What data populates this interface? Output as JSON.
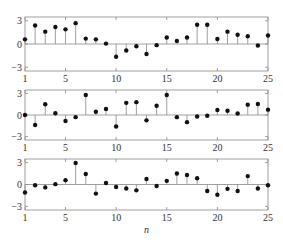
{
  "chart_data": [
    {
      "type": "stem",
      "title": "",
      "xlabel": "",
      "ylabel": "",
      "xlim": [
        1,
        25
      ],
      "ylim": [
        -3.5,
        3.5
      ],
      "xticks": [
        "1",
        "5",
        "10",
        "15",
        "20",
        "25"
      ],
      "yticks": [
        "3",
        "0",
        "-3"
      ],
      "grid": false,
      "x": [
        1,
        2,
        3,
        4,
        5,
        6,
        7,
        8,
        9,
        10,
        11,
        12,
        13,
        14,
        15,
        16,
        17,
        18,
        19,
        20,
        21,
        22,
        23,
        24,
        25
      ],
      "values": [
        0.6,
        2.4,
        1.6,
        2.2,
        1.9,
        2.7,
        0.7,
        0.6,
        0.05,
        -1.65,
        -0.85,
        -0.3,
        -1.3,
        -0.15,
        0.85,
        0.4,
        0.85,
        2.5,
        2.5,
        0.65,
        1.6,
        1.2,
        1.0,
        -0.2,
        1.1
      ]
    },
    {
      "type": "stem",
      "title": "",
      "xlabel": "",
      "ylabel": "",
      "xlim": [
        1,
        25
      ],
      "ylim": [
        -3.5,
        3.5
      ],
      "xticks": [
        "1",
        "5",
        "10",
        "15",
        "20",
        "25"
      ],
      "yticks": [
        "3",
        "0",
        "-3"
      ],
      "grid": false,
      "x": [
        1,
        2,
        3,
        4,
        5,
        6,
        7,
        8,
        9,
        10,
        11,
        12,
        13,
        14,
        15,
        16,
        17,
        18,
        19,
        20,
        21,
        22,
        23,
        24,
        25
      ],
      "values": [
        0.0,
        -1.4,
        1.5,
        0.25,
        -0.85,
        -0.3,
        2.8,
        0.45,
        0.85,
        -1.6,
        1.7,
        1.8,
        -0.75,
        1.3,
        2.8,
        -0.3,
        -1.0,
        -0.2,
        -0.1,
        0.7,
        0.6,
        0.2,
        1.45,
        1.55,
        0.75
      ]
    },
    {
      "type": "stem",
      "title": "",
      "xlabel": "n",
      "ylabel": "",
      "xlim": [
        1,
        25
      ],
      "ylim": [
        -3.5,
        3.5
      ],
      "xticks": [
        "1",
        "5",
        "10",
        "15",
        "20",
        "25"
      ],
      "yticks": [
        "3",
        "0",
        "-3"
      ],
      "grid": false,
      "x": [
        1,
        2,
        3,
        4,
        5,
        6,
        7,
        8,
        9,
        10,
        11,
        12,
        13,
        14,
        15,
        16,
        17,
        18,
        19,
        20,
        21,
        22,
        23,
        24,
        25
      ],
      "values": [
        -1.1,
        -0.1,
        -0.4,
        0.05,
        0.6,
        2.95,
        1.45,
        -1.25,
        0.2,
        -0.35,
        -0.55,
        -0.8,
        0.75,
        -0.2,
        0.5,
        1.5,
        1.3,
        0.85,
        -0.9,
        -1.4,
        -0.6,
        -0.9,
        1.15,
        -0.55,
        -0.1
      ]
    }
  ],
  "colors": {
    "axis": "#888888",
    "stem": "#888888",
    "marker": "#111111",
    "text": "#333333"
  }
}
